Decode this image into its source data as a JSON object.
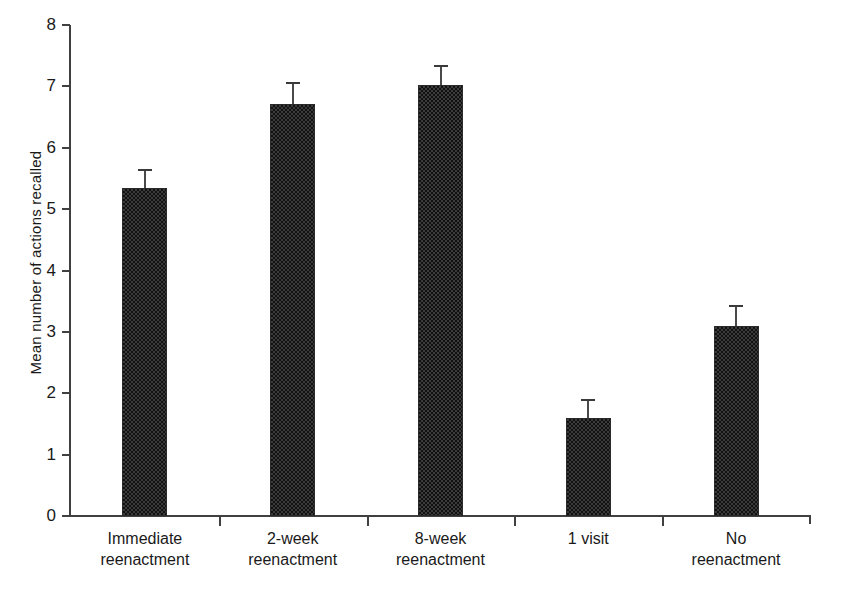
{
  "chart_data": {
    "type": "bar",
    "title": "",
    "xlabel": "",
    "ylabel": "Mean number of actions recalled",
    "ylim": [
      0,
      8
    ],
    "ytick_labels": [
      "0",
      "1",
      "2",
      "3",
      "4",
      "5",
      "6",
      "7",
      "8"
    ],
    "grid": false,
    "legend": null,
    "categories": [
      "Immediate reenactment",
      "2-week reenactment",
      "8-week reenactment",
      "1 visit",
      "No reenactment"
    ],
    "category_lines": [
      [
        "Immediate",
        "reenactment"
      ],
      [
        "2-week",
        "reenactment"
      ],
      [
        "8-week",
        "reenactment"
      ],
      [
        "1 visit",
        ""
      ],
      [
        "No",
        "reenactment"
      ]
    ],
    "values": [
      5.35,
      6.71,
      7.02,
      1.6,
      3.1
    ],
    "errors": [
      0.31,
      0.36,
      0.33,
      0.31,
      0.33
    ],
    "error_type": "standard error",
    "bar_color": "#3b3b3b",
    "axis_color": "#404040",
    "text_color": "#1a1a1a",
    "background": "#ffffff"
  }
}
